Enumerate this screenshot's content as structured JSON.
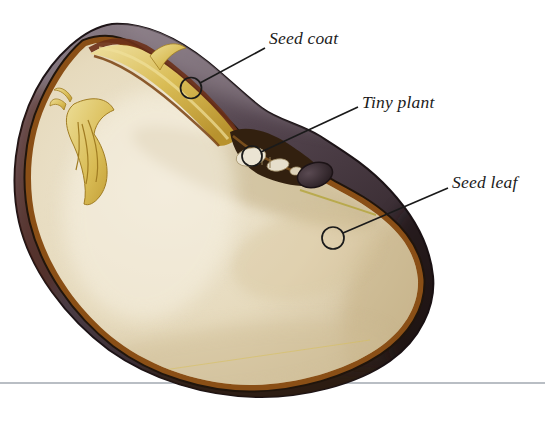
{
  "figure": {
    "type": "seed-cross-section-diagram",
    "background": "#ffffff",
    "labels": {
      "seed_coat": "Seed coat",
      "tiny_plant": "Tiny plant",
      "seed_leaf": "Seed leaf"
    },
    "colors": {
      "seed_coat_dark": "#43363d",
      "seed_coat_highlight": "#8d8089",
      "seed_coat_edge": "#1c1316",
      "inner_rim_amber": "#8a4f16",
      "boundary_dark": "#20150c",
      "cotyledon_cream": "#e8ddc3",
      "embryo_yellow": "#d9bc55",
      "embryo_yellow_highlight": "#efe2a0",
      "hilum_dark": "#34282e",
      "label_text": "#1b1b1b",
      "leader_line": "#1a1a1a",
      "ground_line": "#a2a8b0"
    }
  }
}
